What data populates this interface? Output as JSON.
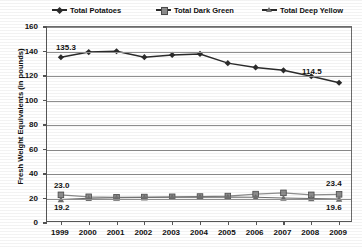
{
  "legend": {
    "items": [
      {
        "label": "Total Potatoes",
        "marker": "diamond-marker-icon"
      },
      {
        "label": "Total Dark Green",
        "marker": "square-marker-icon"
      },
      {
        "label": "Total Deep Yellow",
        "marker": "triangle-marker-icon"
      }
    ]
  },
  "axes": {
    "ylabel": "Fresh Weight Equivalents (in pounds)",
    "yticks": [
      "0",
      "20",
      "40",
      "60",
      "80",
      "100",
      "120",
      "140",
      "160"
    ],
    "xticks": [
      "1999",
      "2000",
      "2001",
      "2002",
      "2003",
      "2004",
      "2005",
      "2006",
      "2007",
      "2008",
      "2009"
    ]
  },
  "annotations": {
    "potatoes_first": "135.3",
    "potatoes_last": "114.5",
    "darkgreen_first": "23.0",
    "darkgreen_last": "23.4",
    "deepyellow_first": "19.2",
    "deepyellow_last": "19.6"
  },
  "colors": {
    "potatoes": "#2b2b2b",
    "dark_green": "#8d8d8d",
    "deep_yellow": "#6f6f6f",
    "grid": "#8e8e8e",
    "axis": "#555555"
  },
  "chart_data": {
    "type": "line",
    "title": "",
    "xlabel": "",
    "ylabel": "Fresh Weight Equivalents (in pounds)",
    "x": [
      1999,
      2000,
      2001,
      2002,
      2003,
      2004,
      2005,
      2006,
      2007,
      2008,
      2009
    ],
    "ylim": [
      0,
      160
    ],
    "ytick_step": 20,
    "grid": true,
    "legend_position": "top",
    "series": [
      {
        "name": "Total Potatoes",
        "marker": "diamond",
        "values": [
          135.3,
          139.5,
          140.2,
          135.4,
          137.2,
          138.0,
          130.5,
          127.0,
          124.6,
          119.8,
          114.5
        ],
        "labels": {
          "1999": "135.3",
          "2009": "114.5"
        }
      },
      {
        "name": "Total Dark Green",
        "marker": "square",
        "values": [
          23.0,
          21.4,
          21.0,
          21.2,
          21.4,
          21.6,
          22.0,
          23.6,
          24.6,
          23.0,
          23.4
        ],
        "labels": {
          "1999": "23.0",
          "2009": "23.4"
        }
      },
      {
        "name": "Total Deep Yellow",
        "marker": "triangle",
        "values": [
          19.2,
          20.2,
          20.6,
          20.8,
          21.0,
          21.4,
          21.2,
          21.0,
          20.4,
          20.0,
          19.6
        ],
        "labels": {
          "1999": "19.2",
          "2009": "19.6"
        }
      }
    ]
  }
}
